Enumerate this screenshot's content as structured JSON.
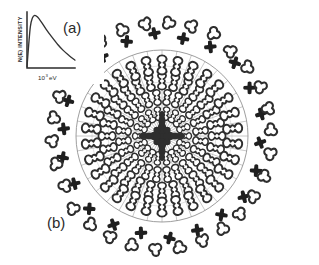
{
  "figure": {
    "background_color": "#ffffff",
    "width": 319,
    "height": 265
  },
  "panels": {
    "a": {
      "label": "(a)",
      "label_x": 63,
      "label_y": 33,
      "type": "inset-spectrum-plot"
    },
    "b": {
      "label": "(b)",
      "label_x": 47,
      "label_y": 228,
      "type": "radial-cluster-diagram"
    }
  },
  "inset_plot": {
    "frame": {
      "x": 27,
      "y": 12,
      "width": 48,
      "height": 56
    },
    "y_axis_label": "N(E) INTENSITY",
    "x_axis_label": "10",
    "x_axis_label_exponent": "3",
    "x_axis_label_unit": "eV",
    "axis_color": "#2b2b2b",
    "curve_color": "#333333"
  },
  "chart_data": {
    "type": "line",
    "title": "",
    "xlabel": "10^3 eV",
    "ylabel": "N(E) INTENSITY",
    "xlim": [
      0,
      10
    ],
    "ylim": [
      0,
      10
    ],
    "grid": false,
    "legend": "none",
    "x": [
      0.0,
      0.35,
      0.7,
      1.1,
      1.6,
      2.2,
      3.0,
      4.0,
      5.2,
      6.4,
      7.6,
      8.8,
      10.0
    ],
    "y": [
      0.2,
      4.1,
      7.4,
      8.9,
      9.4,
      9.1,
      8.2,
      6.9,
      5.5,
      4.2,
      3.1,
      2.2,
      1.4
    ],
    "series": [
      {
        "name": "N(E) spectrum",
        "values": [
          0.2,
          4.1,
          7.4,
          8.9,
          9.4,
          9.1,
          8.2,
          6.9,
          5.5,
          4.2,
          3.1,
          2.2,
          1.4
        ]
      }
    ]
  },
  "radial_diagram": {
    "center_x": 162,
    "center_y": 136,
    "boundary_radius": 86,
    "boundary_color": "#8c8c8c",
    "spoke_count": 36,
    "spoke_color": "#9a9a9a",
    "inner_ring_radii": [
      22,
      38,
      54,
      70
    ],
    "glyph_dark_color": "#2e2e2e",
    "glyph_outline_fill": "#ffffff",
    "cross_color": "#1f1f1f",
    "rings": [
      {
        "name": "core-cluster",
        "radius": 0,
        "glyph": "bowtie-dense",
        "count": 1
      },
      {
        "name": "inner-ring-1",
        "radius": 22,
        "glyph": "bowtie",
        "count": 18
      },
      {
        "name": "inner-ring-2",
        "radius": 38,
        "glyph": "bowtie",
        "count": 24
      },
      {
        "name": "inner-ring-3",
        "radius": 54,
        "glyph": "bowtie",
        "count": 28
      },
      {
        "name": "inner-ring-4",
        "radius": 70,
        "glyph": "bowtie",
        "count": 30
      },
      {
        "name": "cross-ring",
        "radius": 101,
        "glyph": "plus-cross",
        "count": 22
      },
      {
        "name": "trefoil-ring",
        "radius": 112,
        "glyph": "trefoil-outline",
        "count": 30
      }
    ]
  }
}
